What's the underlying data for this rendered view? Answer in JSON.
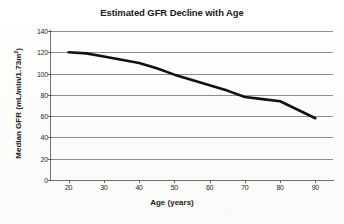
{
  "chart_data": {
    "type": "line",
    "title": "Estimated GFR Decline with Age",
    "xlabel": "Age (years)",
    "ylabel_prefix": "Median GFR  (mL/min/1.73m",
    "ylabel_sup": "2",
    "ylabel_suffix": ")",
    "ylabel_plain": "Median GFR (mL/min/1.73m2)",
    "xlim": [
      15,
      95
    ],
    "ylim": [
      0,
      140
    ],
    "xticks": [
      20,
      30,
      40,
      50,
      60,
      70,
      80,
      90
    ],
    "yticks": [
      0,
      20,
      40,
      60,
      80,
      100,
      120,
      140
    ],
    "grid": "horizontal",
    "legend": "none",
    "series": [
      {
        "name": "Median GFR",
        "color": "#111111",
        "linewidth": 2.6,
        "x": [
          20,
          25,
          30,
          35,
          40,
          45,
          50,
          55,
          60,
          65,
          70,
          75,
          80,
          85,
          90
        ],
        "values": [
          120,
          119,
          116,
          113,
          110,
          105,
          99,
          94,
          89,
          84,
          78,
          76,
          74,
          66,
          58
        ]
      }
    ]
  },
  "axis": {
    "y_tick_labels": [
      "140",
      "120",
      "100",
      "80",
      "60",
      "40",
      "20",
      "0"
    ],
    "x_tick_labels": [
      "20",
      "30",
      "40",
      "50",
      "60",
      "70",
      "80",
      "90"
    ]
  }
}
